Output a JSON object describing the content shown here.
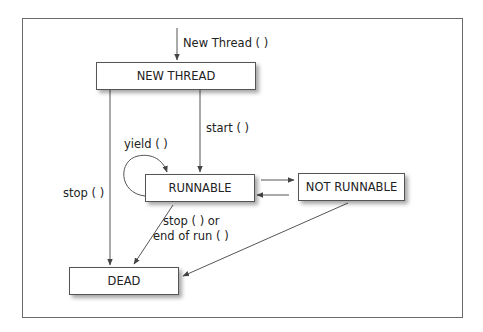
{
  "diagram": {
    "states": {
      "new_thread": "NEW THREAD",
      "runnable": "RUNNABLE",
      "not_runnable": "NOT RUNNABLE",
      "dead": "DEAD"
    },
    "transitions": {
      "create": "New Thread ( )",
      "start": "start ( )",
      "yield": "yield ( )",
      "stop_new": "stop ( )",
      "stop_runnable_line1": "stop ( ) or",
      "stop_runnable_line2": "end of run ( )"
    },
    "edges": [
      {
        "from": "external",
        "to": "new_thread",
        "label": "New Thread ( )"
      },
      {
        "from": "new_thread",
        "to": "runnable",
        "label": "start ( )"
      },
      {
        "from": "new_thread",
        "to": "dead",
        "label": "stop ( )"
      },
      {
        "from": "runnable",
        "to": "runnable",
        "label": "yield ( )"
      },
      {
        "from": "runnable",
        "to": "not_runnable",
        "label": ""
      },
      {
        "from": "not_runnable",
        "to": "runnable",
        "label": ""
      },
      {
        "from": "runnable",
        "to": "dead",
        "label": "stop ( ) or end of run ( )"
      },
      {
        "from": "not_runnable",
        "to": "dead",
        "label": ""
      }
    ],
    "colors": {
      "line": "#555555",
      "border": "#555555",
      "text": "#222222",
      "frame": "#6a6a6a"
    }
  }
}
